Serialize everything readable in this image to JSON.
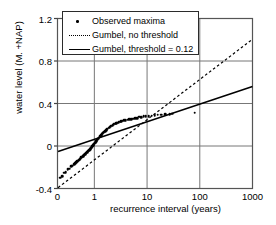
{
  "chart_data": {
    "type": "scatter",
    "title": "",
    "xlabel": "recurrence interval (years)",
    "ylabel": "water level (M. +NAP)",
    "xscale": "log",
    "xlim": [
      0.2,
      1000
    ],
    "ylim": [
      -0.4,
      1.2
    ],
    "xticks": [
      "0",
      "1",
      "10",
      "100",
      "1000"
    ],
    "xtick_values": [
      0.2,
      1,
      10,
      100,
      1000
    ],
    "yticks": [
      "1.2",
      "0.8",
      "0.4",
      "0",
      "-0.4"
    ],
    "ytick_values": [
      1.2,
      0.8,
      0.4,
      0,
      -0.4
    ],
    "grid": true,
    "legend_position": "top-left",
    "legend": [
      {
        "label": "Observed maxima",
        "marker": "dot"
      },
      {
        "label": "Gumbel, no threshold",
        "marker": "dashed-line"
      },
      {
        "label": "Gumbel, threshold = 0.12",
        "marker": "solid-line"
      }
    ],
    "series": [
      {
        "name": "Observed maxima",
        "type": "scatter",
        "points": [
          [
            0.225,
            -0.3
          ],
          [
            0.245,
            -0.285
          ],
          [
            0.265,
            -0.25
          ],
          [
            0.285,
            -0.248
          ],
          [
            0.31,
            -0.218
          ],
          [
            0.335,
            -0.215
          ],
          [
            0.36,
            -0.19
          ],
          [
            0.385,
            -0.185
          ],
          [
            0.41,
            -0.17
          ],
          [
            0.43,
            -0.16
          ],
          [
            0.45,
            -0.152
          ],
          [
            0.47,
            -0.145
          ],
          [
            0.49,
            -0.138
          ],
          [
            0.51,
            -0.13
          ],
          [
            0.53,
            -0.122
          ],
          [
            0.55,
            -0.115
          ],
          [
            0.57,
            -0.108
          ],
          [
            0.59,
            -0.1
          ],
          [
            0.61,
            -0.094
          ],
          [
            0.63,
            -0.088
          ],
          [
            0.65,
            -0.082
          ],
          [
            0.67,
            -0.076
          ],
          [
            0.69,
            -0.07
          ],
          [
            0.71,
            -0.064
          ],
          [
            0.73,
            -0.058
          ],
          [
            0.75,
            -0.052
          ],
          [
            0.77,
            -0.046
          ],
          [
            0.79,
            -0.04
          ],
          [
            0.81,
            -0.034
          ],
          [
            0.83,
            -0.028
          ],
          [
            0.85,
            -0.022
          ],
          [
            0.87,
            -0.016
          ],
          [
            0.89,
            -0.01
          ],
          [
            0.91,
            -0.004
          ],
          [
            0.93,
            0.002
          ],
          [
            0.95,
            0.008
          ],
          [
            0.975,
            0.015
          ],
          [
            1.0,
            0.022
          ],
          [
            1.025,
            0.03
          ],
          [
            1.055,
            0.038
          ],
          [
            1.085,
            0.046
          ],
          [
            1.115,
            0.054
          ],
          [
            1.15,
            0.062
          ],
          [
            1.185,
            0.07
          ],
          [
            1.22,
            0.078
          ],
          [
            1.26,
            0.086
          ],
          [
            1.3,
            0.094
          ],
          [
            1.345,
            0.102
          ],
          [
            1.39,
            0.11
          ],
          [
            1.44,
            0.118
          ],
          [
            1.49,
            0.126
          ],
          [
            1.545,
            0.134
          ],
          [
            1.6,
            0.142
          ],
          [
            1.66,
            0.15
          ],
          [
            1.725,
            0.157
          ],
          [
            1.795,
            0.164
          ],
          [
            1.87,
            0.171
          ],
          [
            1.95,
            0.178
          ],
          [
            2.035,
            0.185
          ],
          [
            2.13,
            0.191
          ],
          [
            2.23,
            0.197
          ],
          [
            2.34,
            0.203
          ],
          [
            2.46,
            0.209
          ],
          [
            2.59,
            0.214
          ],
          [
            2.73,
            0.219
          ],
          [
            2.89,
            0.224
          ],
          [
            3.06,
            0.229
          ],
          [
            3.25,
            0.233
          ],
          [
            3.46,
            0.237
          ],
          [
            3.7,
            0.241
          ],
          [
            3.96,
            0.245
          ],
          [
            4.26,
            0.249
          ],
          [
            4.6,
            0.252
          ],
          [
            4.99,
            0.255
          ],
          [
            5.44,
            0.258
          ],
          [
            5.96,
            0.261
          ],
          [
            6.55,
            0.263
          ],
          [
            7.1,
            0.275
          ],
          [
            7.8,
            0.272
          ],
          [
            8.6,
            0.278
          ],
          [
            9.5,
            0.281
          ],
          [
            10.8,
            0.283
          ],
          [
            12.3,
            0.286
          ],
          [
            14.0,
            0.288
          ],
          [
            16.0,
            0.293
          ],
          [
            18.5,
            0.296
          ],
          [
            22.0,
            0.297
          ],
          [
            27.0,
            0.302
          ],
          [
            30.0,
            0.305
          ],
          [
            80.0,
            0.312
          ]
        ]
      },
      {
        "name": "Gumbel, no threshold",
        "type": "line",
        "style": "dashed",
        "points": [
          [
            0.205,
            -0.392
          ],
          [
            1000,
            1.005
          ]
        ]
      },
      {
        "name": "Gumbel, threshold = 0.12",
        "type": "line",
        "style": "solid",
        "points": [
          [
            0.205,
            -0.052
          ],
          [
            1000,
            0.56
          ]
        ]
      }
    ]
  }
}
